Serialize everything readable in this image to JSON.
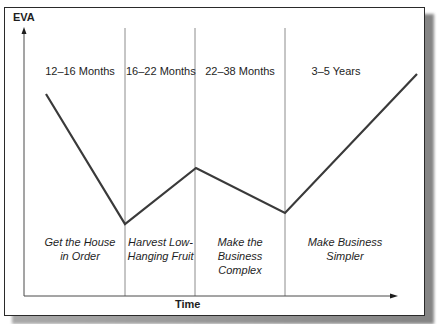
{
  "diagram": {
    "y_axis_label": "EVA",
    "x_axis_label": "Time",
    "phases": [
      {
        "duration": "12–16 Months",
        "description": "Get the House\nin Order"
      },
      {
        "duration": "16–22 Months",
        "description": "Harvest Low-\nHanging Fruit"
      },
      {
        "duration": "22–38 Months",
        "description": "Make the\nBusiness\nComplex"
      },
      {
        "duration": "3–5 Years",
        "description": "Make Business\nSimpler"
      }
    ],
    "eva_curve_points": [
      {
        "x": 46,
        "y": 94
      },
      {
        "x": 125,
        "y": 224
      },
      {
        "x": 196,
        "y": 168
      },
      {
        "x": 285,
        "y": 213
      },
      {
        "x": 417,
        "y": 74
      }
    ],
    "colors": {
      "line": "#3a3a3a",
      "divider": "#8c8c8c",
      "axis": "#4a4a4a",
      "frame": "#2a2a2a",
      "text": "#1e1e1e"
    }
  }
}
